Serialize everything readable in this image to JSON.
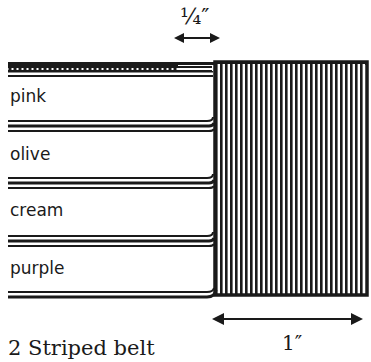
{
  "diagram": {
    "caption": "2 Striped belt",
    "dimension_top": "¼″",
    "dimension_bottom": "1″",
    "stripes": [
      {
        "label": "pink"
      },
      {
        "label": "olive"
      },
      {
        "label": "cream"
      },
      {
        "label": "purple"
      }
    ],
    "colors": {
      "ink": "#1a1a1a",
      "background": "#ffffff"
    }
  }
}
